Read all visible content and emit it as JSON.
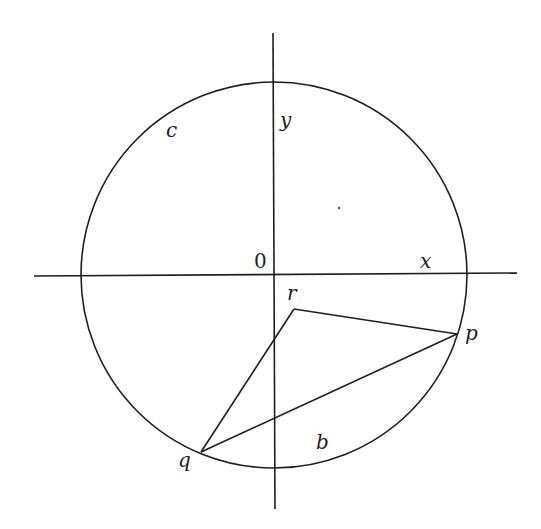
{
  "diagram": {
    "axes": {
      "x_label": "x",
      "y_label": "y",
      "origin_label": "0"
    },
    "circle": {
      "label": "c",
      "arc_label": "b"
    },
    "points": {
      "p": {
        "label": "p"
      },
      "q": {
        "label": "q"
      },
      "r": {
        "label": "r"
      }
    },
    "segments": [
      "rp",
      "rq",
      "pq"
    ],
    "colors": {
      "stroke": "#1e1e1e",
      "background": "#ffffff"
    }
  }
}
